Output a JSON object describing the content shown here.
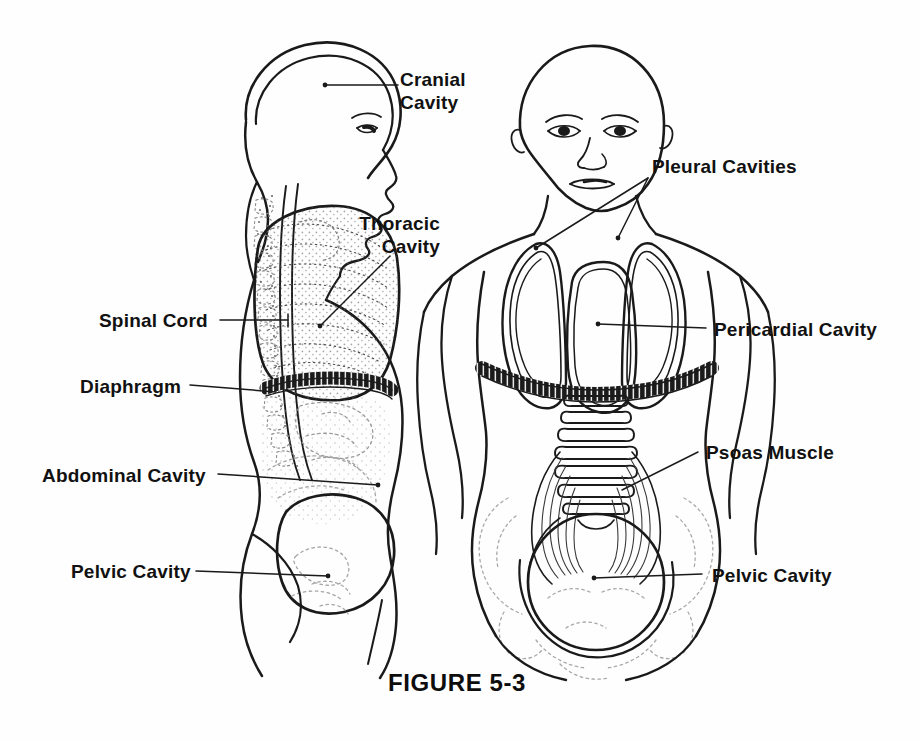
{
  "figure": {
    "caption": "FIGURE 5-3",
    "background_color": "#fefefe",
    "ink_color": "#111111"
  },
  "labels": {
    "cranial_cavity": "Cranial\nCavity",
    "thoracic_cavity": "Thoracic\nCavity",
    "spinal_cord": "Spinal Cord",
    "diaphragm": "Diaphragm",
    "abdominal_cavity": "Abdominal Cavity",
    "pelvic_cavity_left": "Pelvic Cavity",
    "pleural_cavities": "Pleural Cavities",
    "pericardial_cavity": "Pericardial Cavity",
    "psoas_muscle": "Psoas Muscle",
    "pelvic_cavity_right": "Pelvic Cavity"
  },
  "views": {
    "lateral": "Lateral (sagittal) view of head and trunk",
    "anterior": "Anterior (frontal) view of head and trunk"
  },
  "structures": [
    "cranial cavity",
    "thoracic cavity",
    "spinal cord",
    "diaphragm",
    "abdominal cavity",
    "pelvic cavity",
    "pleural cavities",
    "pericardial cavity",
    "psoas muscle",
    "lumbar vertebrae"
  ]
}
